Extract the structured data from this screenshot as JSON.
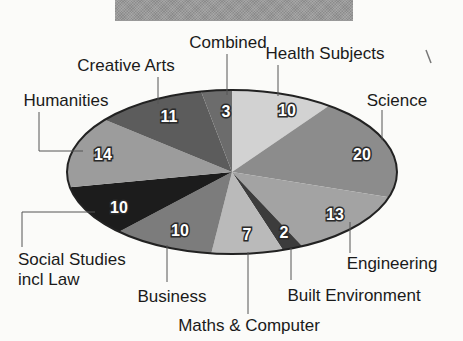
{
  "banner": {
    "title": ""
  },
  "chart_data": {
    "type": "pie",
    "title": "",
    "unit": "percent",
    "start": "12 o'clock, clockwise",
    "categories": [
      "Health Subjects",
      "Science",
      "Engineering",
      "Built Environment",
      "Maths & Computer",
      "Business",
      "Social Studies incl Law",
      "Humanities",
      "Creative Arts",
      "Combined"
    ],
    "values": [
      10,
      20,
      13,
      2,
      7,
      10,
      10,
      14,
      11,
      3
    ],
    "colors": [
      "#d2d2d2",
      "#8c8c8c",
      "#a3a3a3",
      "#3c3c3c",
      "#bababa",
      "#7c7c7c",
      "#1c1c1c",
      "#9c9c9c",
      "#5c5c5c",
      "#6c6c6c"
    ],
    "legend": "none (leader-line labels)"
  },
  "labels": {
    "health": "Health Subjects",
    "science": "Science",
    "engineering": "Engineering",
    "built": "Built Environment",
    "maths": "Maths & Computer",
    "business": "Business",
    "social_1": "Social Studies",
    "social_2": "incl Law",
    "humanities": "Humanities",
    "creative": "Creative Arts",
    "combined": "Combined"
  },
  "values_text": {
    "health": "10",
    "science": "20",
    "engineering": "13",
    "built": "2",
    "maths": "7",
    "business": "10",
    "social": "10",
    "humanities": "14",
    "creative": "11",
    "combined": "3"
  }
}
